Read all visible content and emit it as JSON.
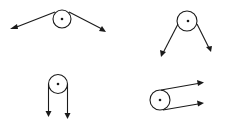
{
  "diagram": {
    "title": "",
    "colors": {
      "stroke": "#1a1a1a",
      "background": "#ffffff"
    },
    "pulleys": [
      {
        "id": "a",
        "label": "",
        "description": "ropes pulled outward diagonally to lower left and lower right"
      },
      {
        "id": "b",
        "label": "",
        "description": "ropes pulled downward diagonally, splayed"
      },
      {
        "id": "c",
        "label": "",
        "description": "both ropes pulled straight down, parallel"
      },
      {
        "id": "d",
        "label": "",
        "description": "both ropes pulled to the right, nearly parallel"
      }
    ]
  }
}
